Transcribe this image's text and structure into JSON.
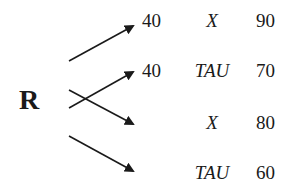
{
  "diagram": {
    "root": "R",
    "rows": [
      {
        "first": "40",
        "symbol": "X",
        "value": "90"
      },
      {
        "first": "40",
        "symbol": "TAU",
        "value": "70"
      },
      {
        "first": "",
        "symbol": "X",
        "value": "80"
      },
      {
        "first": "",
        "symbol": "TAU",
        "value": "60"
      }
    ],
    "arrows": [
      {
        "from": [
          69,
          61
        ],
        "to": [
          133,
          26
        ]
      },
      {
        "from": [
          69,
          108
        ],
        "to": [
          133,
          72
        ]
      },
      {
        "from": [
          69,
          90
        ],
        "to": [
          133,
          124
        ]
      },
      {
        "from": [
          69,
          136
        ],
        "to": [
          133,
          171
        ]
      }
    ],
    "colors": {
      "stroke": "#1a1a1a",
      "background": "#ffffff"
    }
  }
}
